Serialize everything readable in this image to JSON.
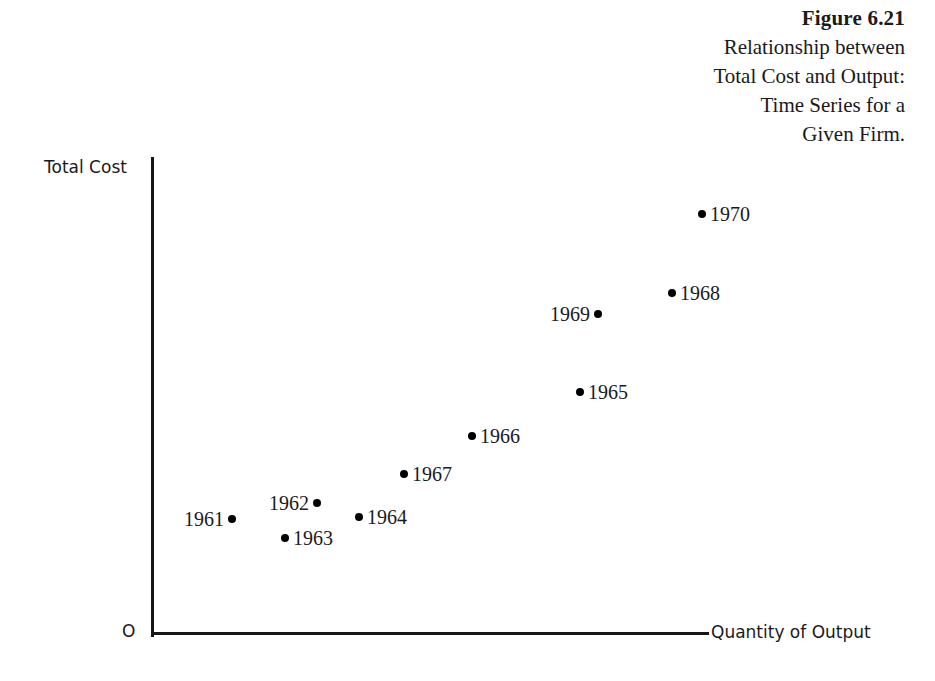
{
  "figure": {
    "number": "Figure 6.21",
    "caption_lines": [
      "Relationship between",
      "Total Cost and Output:",
      "Time Series for a",
      "Given Firm."
    ]
  },
  "axes": {
    "y_label": "Total Cost",
    "x_label": "Quantity of Output",
    "origin_label": "O"
  },
  "colors": {
    "background": "#ffffff",
    "axis": "#161616",
    "point": "#000000",
    "text": "#1a1a1a"
  },
  "chart_data": {
    "type": "scatter",
    "title": "Relationship between Total Cost and Output: Time Series for a Given Firm.",
    "figure_number": "Figure 6.21",
    "xlabel": "Quantity of Output",
    "ylabel": "Total Cost",
    "grid": false,
    "legend": "none",
    "axis_ticks": "none",
    "origin_marker": "O",
    "xlim": [
      0,
      100
    ],
    "ylim": [
      0,
      100
    ],
    "note": "Axes are unscaled (no numeric ticks). x/y values below are normalized 0-100 estimates read off pixel positions relative to the origin at the axis intersection.",
    "points": [
      {
        "label": "1961",
        "x": 14.3,
        "y": 24.1,
        "label_side": "left",
        "px": 232,
        "py": 519
      },
      {
        "label": "1962",
        "x": 29.6,
        "y": 27.3,
        "label_side": "left",
        "px": 317,
        "py": 503
      },
      {
        "label": "1963",
        "x": 23.9,
        "y": 20.1,
        "label_side": "right",
        "px": 285,
        "py": 538
      },
      {
        "label": "1964",
        "x": 37.2,
        "y": 24.5,
        "label_side": "right",
        "px": 359,
        "py": 517
      },
      {
        "label": "1965",
        "x": 76.9,
        "y": 50.6,
        "label_side": "right",
        "px": 580,
        "py": 392
      },
      {
        "label": "1966",
        "x": 57.5,
        "y": 41.2,
        "label_side": "right",
        "px": 472,
        "py": 436
      },
      {
        "label": "1967",
        "x": 45.3,
        "y": 33.3,
        "label_side": "right",
        "px": 404,
        "py": 474
      },
      {
        "label": "1968",
        "x": 93.4,
        "y": 71.0,
        "label_side": "right",
        "px": 672,
        "py": 293
      },
      {
        "label": "1969",
        "x": 80.2,
        "y": 66.4,
        "label_side": "left",
        "px": 598,
        "py": 314
      },
      {
        "label": "1970",
        "x": 98.9,
        "y": 87.3,
        "label_side": "right",
        "px": 702,
        "py": 214
      }
    ]
  }
}
